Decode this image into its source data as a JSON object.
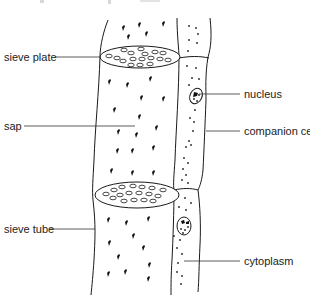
{
  "diagram": {
    "labels": {
      "sieve_plate": "sieve plate",
      "sap": "sap",
      "nucleus": "nucleus",
      "companion_cell": "companion cell",
      "sieve_tube": "sieve tube",
      "cytoplasm": "cytoplasm"
    },
    "colors": {
      "line": "#1a1a1a",
      "text": "#222222",
      "background": "#ffffff"
    }
  }
}
